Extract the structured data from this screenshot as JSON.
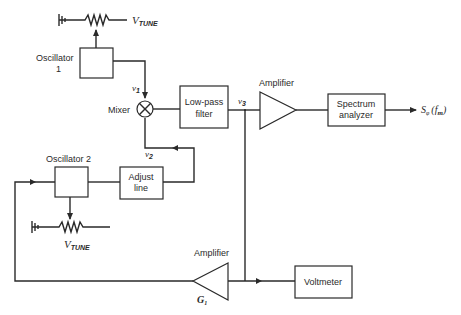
{
  "diagram": {
    "oscillator1": {
      "label_line1": "Oscillator",
      "label_line2": "1"
    },
    "oscillator2": {
      "label": "Oscillator 2"
    },
    "vtune1": {
      "v": "V",
      "sub": "TUNE"
    },
    "vtune2": {
      "v": "V",
      "sub": "TUNE"
    },
    "mixer": {
      "label": "Mixer"
    },
    "signals": {
      "v1": {
        "v": "v",
        "sub": "1"
      },
      "v2": {
        "v": "v",
        "sub": "2"
      },
      "v3": {
        "v": "v",
        "sub": "3"
      }
    },
    "lowpass": {
      "line1": "Low-pass",
      "line2": "filter"
    },
    "amplifier_top": {
      "label": "Amplifier"
    },
    "spectrum": {
      "line1": "Spectrum",
      "line2": "analyzer"
    },
    "output": {
      "s": "S",
      "sub": "φ",
      "paren_open": "(",
      "f": "f",
      "fsub": "m",
      "paren_close": ")"
    },
    "adjust_line": {
      "line1": "Adjust",
      "line2": "line"
    },
    "amplifier_bottom": {
      "label": "Amplifier",
      "gain": "G",
      "gain_sub": "1"
    },
    "voltmeter": {
      "label": "Voltmeter"
    }
  }
}
